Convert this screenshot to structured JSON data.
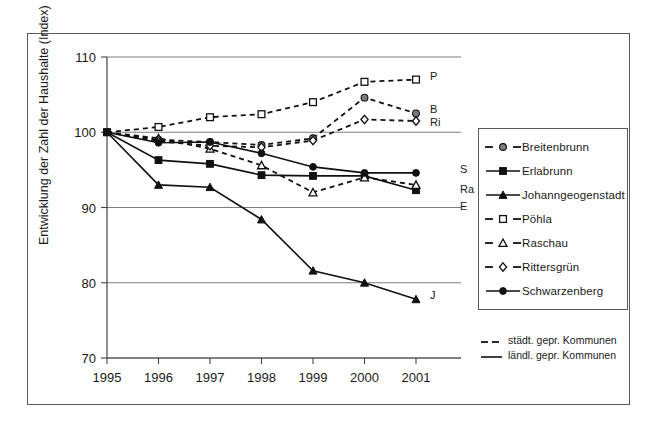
{
  "chart_data": {
    "type": "line",
    "title": "",
    "xlabel": "",
    "ylabel": "Entwicklung der Zahl der Haushalte (Index)",
    "x": [
      "1995",
      "1996",
      "1997",
      "1998",
      "1999",
      "2000",
      "2001"
    ],
    "xtick_labels": [
      "1995",
      "1996",
      "1997",
      "1998",
      "1999",
      "2000",
      "2001"
    ],
    "ytick_labels": [
      "110",
      "100",
      "90",
      "80",
      "70"
    ],
    "ylim": [
      70,
      110
    ],
    "ytick_values": [
      110,
      100,
      90,
      80,
      70
    ],
    "grid": "horizontal",
    "legend_position": "right",
    "series": [
      {
        "name": "Breitenbrunn",
        "end_label": "B",
        "style": "dashed",
        "marker": "circle-grey",
        "group": "staedt",
        "values": [
          100,
          99,
          98.7,
          98.3,
          99.2,
          104.6,
          102.5
        ]
      },
      {
        "name": "Erlabrunn",
        "end_label": "E",
        "style": "solid",
        "marker": "square-filled",
        "group": "laendl",
        "values": [
          100,
          96.3,
          95.8,
          94.3,
          94.2,
          94.2,
          92.3
        ]
      },
      {
        "name": "Johanngeogenstadt",
        "end_label": "J",
        "style": "solid",
        "marker": "triangle-filled",
        "group": "laendl",
        "values": [
          100,
          93.0,
          92.7,
          88.4,
          81.6,
          80.0,
          77.8
        ]
      },
      {
        "name": "Pöhla",
        "end_label": "P",
        "style": "dashed",
        "marker": "square-open",
        "group": "staedt",
        "values": [
          100,
          100.7,
          102.0,
          102.4,
          104.0,
          106.7,
          107.0
        ]
      },
      {
        "name": "Raschau",
        "end_label": "Ra",
        "style": "dashed",
        "marker": "triangle-open",
        "group": "staedt",
        "values": [
          100,
          99.2,
          97.8,
          95.6,
          92.0,
          94.0,
          93.0
        ]
      },
      {
        "name": "Rittersgrün",
        "end_label": "Ri",
        "style": "dashed",
        "marker": "diamond-open",
        "group": "staedt",
        "values": [
          100,
          98.8,
          98.2,
          98.0,
          98.9,
          101.7,
          101.5
        ]
      },
      {
        "name": "Schwarzenberg",
        "end_label": "S",
        "style": "solid",
        "marker": "circle-filled",
        "group": "laendl",
        "values": [
          100,
          98.6,
          98.7,
          97.2,
          95.4,
          94.6,
          94.6
        ]
      }
    ],
    "annotations": [
      {
        "text": "P",
        "value": 107.0
      },
      {
        "text": "B",
        "value": 102.5
      },
      {
        "text": "Ri",
        "value": 101.5
      },
      {
        "text": "S",
        "value": 94.6
      },
      {
        "text": "Ra",
        "value": 93.0
      },
      {
        "text": "E",
        "value": 92.3
      },
      {
        "text": "J",
        "value": 77.8
      }
    ]
  },
  "legend": {
    "items": [
      {
        "label": "Breitenbrunn",
        "marker": "circle-grey",
        "style": "dashed"
      },
      {
        "label": "Erlabrunn",
        "marker": "square-filled",
        "style": "solid"
      },
      {
        "label": "Johanngeogenstadt",
        "marker": "triangle-filled",
        "style": "solid"
      },
      {
        "label": "Pöhla",
        "marker": "square-open",
        "style": "dashed"
      },
      {
        "label": "Raschau",
        "marker": "triangle-open",
        "style": "dashed"
      },
      {
        "label": "Rittersgrün",
        "marker": "diamond-open",
        "style": "dashed"
      },
      {
        "label": "Schwarzenberg",
        "marker": "circle-filled",
        "style": "solid"
      }
    ]
  },
  "linestyle_legend": {
    "items": [
      {
        "label": "städt. gepr. Kommunen",
        "style": "dashed"
      },
      {
        "label": "ländl. gepr. Kommunen",
        "style": "solid"
      }
    ]
  },
  "colors": {
    "line": "#111111",
    "grid": "#6e6e6e",
    "frame": "#5a5a5a",
    "marker_grey": "#7b7b7b",
    "background": "#ffffff"
  }
}
